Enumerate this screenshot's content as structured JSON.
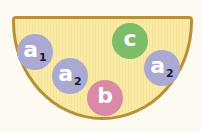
{
  "diagram": {
    "container": {
      "shape": "half-bowl",
      "fill": "#f9eaa5",
      "border": "#b8903a"
    },
    "balls": [
      {
        "label": "a",
        "subscript": "1",
        "color": "#a9a9d2",
        "cx": 35,
        "cy": 52
      },
      {
        "label": "a",
        "subscript": "2",
        "color": "#a9a9d2",
        "cx": 70,
        "cy": 76
      },
      {
        "label": "b",
        "subscript": "",
        "color": "#d98aa6",
        "cx": 105,
        "cy": 98
      },
      {
        "label": "c",
        "subscript": "",
        "color": "#7dbd6a",
        "cx": 130,
        "cy": 41
      },
      {
        "label": "a",
        "subscript": "2",
        "color": "#a9a9d2",
        "cx": 162,
        "cy": 68
      }
    ]
  }
}
